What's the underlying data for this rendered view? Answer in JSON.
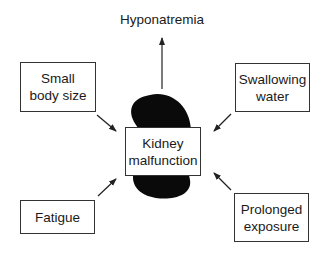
{
  "diagram": {
    "outcome": "Hyponatremia",
    "center": {
      "line1": "Kidney",
      "line2": "malfunction"
    },
    "factors": [
      {
        "id": "small-body-size",
        "line1": "Small",
        "line2": "body size"
      },
      {
        "id": "swallowing-water",
        "line1": "Swallowing",
        "line2": "water"
      },
      {
        "id": "fatigue",
        "line1": "Fatigue",
        "line2": ""
      },
      {
        "id": "prolonged-exposure",
        "line1": "Prolonged",
        "line2": "exposure"
      }
    ],
    "colors": {
      "kidney": "#0a0a0a",
      "line": "#333333"
    }
  }
}
